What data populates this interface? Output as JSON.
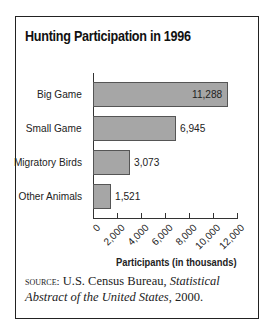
{
  "chart_data": {
    "type": "bar",
    "orientation": "horizontal",
    "title": "Hunting Participation in 1996",
    "categories": [
      "Big Game",
      "Small Game",
      "Migratory Birds",
      "Other Animals"
    ],
    "values": [
      11288,
      6945,
      3073,
      1521
    ],
    "value_labels": [
      "11,288",
      "6,945",
      "3,073",
      "1,521"
    ],
    "xlabel": "Participants (in thousands)",
    "ylabel": "",
    "xlim": [
      0,
      12000
    ],
    "xticks": [
      "0",
      "2,000",
      "4,000",
      "6,000",
      "8,000",
      "10,000",
      "12,000"
    ],
    "grid": false,
    "legend": null,
    "bar_color": "#a6a6a6"
  },
  "source": {
    "label": "SOURCE:",
    "text": " U.S. Census Bureau, ",
    "italic": "Statistical Abstract of the United States",
    "end": ", 2000."
  }
}
